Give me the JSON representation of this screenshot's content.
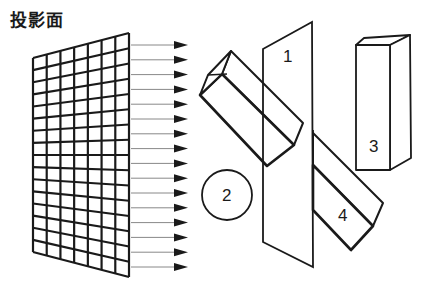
{
  "title": "投影面",
  "grid": {
    "top_left": [
      33,
      58
    ],
    "top_right": [
      129,
      33
    ],
    "bottom_right": [
      129,
      277
    ],
    "bottom_left": [
      33,
      252
    ],
    "columns": 7,
    "rows": 16
  },
  "arrows": {
    "count": 16,
    "x_start": 131,
    "x_end": 188,
    "y_left_first": 45,
    "y_left_last": 267
  },
  "labels": {
    "plane": "1",
    "circle": "2",
    "upright_prism": "3",
    "tilted_prism": "4"
  },
  "colors": {
    "stroke": "#1a1a1a",
    "arrow_line": "#888888",
    "background": "#ffffff"
  }
}
